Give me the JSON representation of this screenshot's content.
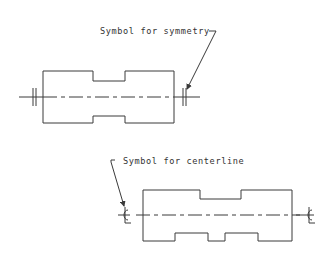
{
  "drawing": {
    "top_figure": {
      "label": "Symbol for symmetry",
      "symbol": "symmetry-marks"
    },
    "bottom_figure": {
      "label": "Symbol for centerline",
      "symbol_left": "℄",
      "symbol_right": "℄"
    },
    "colors": {
      "line": "#3a3a3a",
      "background": "#ffffff"
    }
  }
}
